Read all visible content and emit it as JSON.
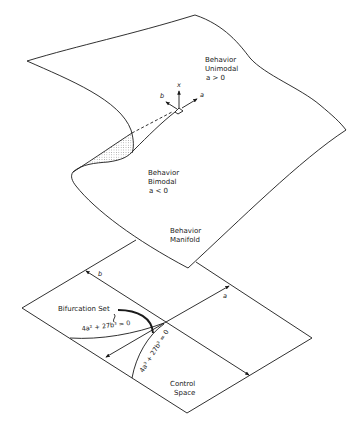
{
  "diagram": {
    "type": "cusp-catastrophe",
    "colors": {
      "ink": "#1a1a1a",
      "background": "#ffffff",
      "shading": "#9a9a9a"
    },
    "manifold": {
      "regions": [
        {
          "id": "unimodal",
          "line1": "Behavior",
          "line2": "Unimodal",
          "line3": "a > 0"
        },
        {
          "id": "bimodal",
          "line1": "Behavior",
          "line2": "Bimodal",
          "line3": "a < 0"
        }
      ],
      "caption": {
        "line1": "Behavior",
        "line2": "Manifold"
      },
      "axes": {
        "x": "x",
        "a": "a",
        "b": "b"
      }
    },
    "control_space": {
      "caption": {
        "line1": "Control",
        "line2": "Space"
      },
      "axis_a": "a",
      "axis_b": "b",
      "bifurcation_label": "Bifurcation Set",
      "equation_upper": "4a² + 27b³ = 0",
      "equation_lower": "4a³ + 27b³ = 0"
    }
  }
}
